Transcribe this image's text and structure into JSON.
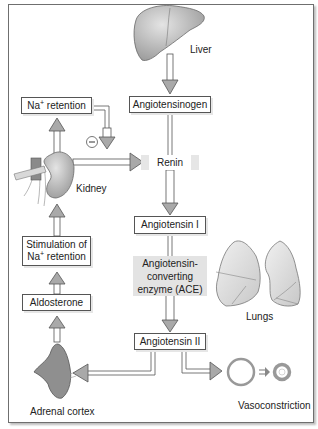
{
  "diagram": {
    "organs": {
      "liver": "Liver",
      "kidney": "Kidney",
      "lungs": "Lungs",
      "adrenal": "Adrenal cortex",
      "vaso": "Vasoconstriction"
    },
    "boxes": {
      "angiotensinogen": "Angiotensinogen",
      "renin": "Renin",
      "angiotensin1": "Angiotensin I",
      "ace_line1": "Angiotensin-",
      "ace_line2": "converting",
      "ace_line3": "enzyme (ACE)",
      "angiotensin2": "Angiotensin II",
      "na_retention_prefix": "Na",
      "na_retention_sup": "+",
      "na_retention_suffix": " retention",
      "stim_line1": "Stimulation of",
      "stim_line2_prefix": "Na",
      "stim_line2_sup": "+",
      "stim_line2_suffix": " retention",
      "aldosterone": "Aldosterone"
    },
    "inhibition_symbol": "−",
    "colors": {
      "arrow_fill": "#a9a9a9",
      "arrow_stroke": "#555555",
      "organ_fill": "#bdbdbd",
      "shade_box": "#e3e3e3"
    }
  }
}
